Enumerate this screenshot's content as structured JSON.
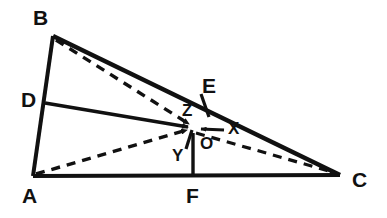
{
  "figure": {
    "type": "geometry-diagram",
    "background_color": "#ffffff",
    "stroke_color": "#111111",
    "canvas": {
      "width": 387,
      "height": 218
    }
  },
  "points": {
    "A": {
      "label": "A",
      "x": 33,
      "y": 176,
      "label_x": 22,
      "label_y": 185
    },
    "B": {
      "label": "B",
      "x": 53,
      "y": 36,
      "label_x": 33,
      "label_y": 7
    },
    "C": {
      "label": "C",
      "x": 340,
      "y": 175,
      "label_x": 352,
      "label_y": 169
    },
    "D": {
      "label": "D",
      "x": 45,
      "y": 103,
      "label_x": 21,
      "label_y": 89
    },
    "E": {
      "label": "E",
      "x": 205,
      "y": 105,
      "label_x": 202,
      "label_y": 75
    },
    "F": {
      "label": "F",
      "x": 193,
      "y": 176,
      "label_x": 186,
      "label_y": 185
    },
    "O": {
      "label": "O",
      "x": 206,
      "y": 141,
      "label_x": 200,
      "label_y": 135
    },
    "X": {
      "label": "X",
      "x": 225,
      "y": 129,
      "label_x": 228,
      "label_y": 120
    },
    "Y": {
      "label": "Y",
      "x": 185,
      "y": 150,
      "label_x": 172,
      "label_y": 147
    },
    "Z": {
      "label": "Z",
      "x": 193,
      "y": 128,
      "label_x": 182,
      "label_y": 102
    }
  },
  "segments": {
    "solid": [
      {
        "name": "side-AB",
        "from": "A",
        "to": "B"
      },
      {
        "name": "side-BC",
        "from": "B",
        "to": "C"
      },
      {
        "name": "side-AC",
        "from": "A",
        "to": "C"
      },
      {
        "name": "segment-DZ",
        "from": "D",
        "to": "Z"
      },
      {
        "name": "segment-OF",
        "from": "O",
        "to": "F"
      }
    ],
    "dashed": [
      {
        "name": "cevian-BZ",
        "from": "B",
        "to": "Z"
      },
      {
        "name": "cevian-AZ",
        "from": "A",
        "to": "Z"
      },
      {
        "name": "cevian-ZC",
        "from": "Z",
        "to": "C"
      }
    ],
    "ticks": [
      {
        "name": "tick-at-E",
        "x1": 201,
        "y1": 95,
        "x2": 209,
        "y2": 116
      },
      {
        "name": "tick-at-Y",
        "x1": 186,
        "y1": 148,
        "x2": 192,
        "y2": 130
      }
    ],
    "arrows": [
      {
        "name": "arrow-to-Z-from-D",
        "points_to": "Z"
      },
      {
        "name": "arrow-to-Z-from-A",
        "points_to": "Z"
      },
      {
        "name": "arrow-to-Z-from-B",
        "points_to": "Z"
      },
      {
        "name": "arrow-to-C",
        "points_to": "C"
      },
      {
        "name": "arrow-X-to-O",
        "from": "X",
        "to": "O"
      }
    ]
  },
  "labels": {
    "major": [
      "A",
      "B",
      "C",
      "D",
      "E",
      "F"
    ],
    "minor": [
      "O",
      "X",
      "Y",
      "Z"
    ]
  }
}
